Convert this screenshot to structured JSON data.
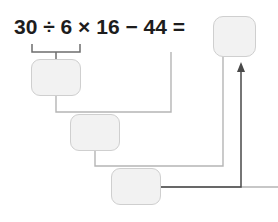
{
  "problem": {
    "type": "order-of-operations-worksheet",
    "equation_text": "30 ÷ 6 × 16 − 44 =",
    "terms": {
      "operand_1": "30",
      "operator_1": "÷",
      "operand_2": "6",
      "operator_2": "×",
      "operand_3": "16",
      "operator_3": "−",
      "operand_4": "44",
      "equals": "="
    }
  },
  "boxes": {
    "step1": {
      "value": "",
      "placeholder": ""
    },
    "step2": {
      "value": "",
      "placeholder": ""
    },
    "step3": {
      "value": "",
      "placeholder": ""
    },
    "answer": {
      "value": "",
      "placeholder": ""
    }
  },
  "colors": {
    "box_fill": "#f2f2f2",
    "box_border": "#cfcfcf",
    "connector": "#b5b5b5",
    "bracket": "#6e6e6e",
    "arrow": "#4a4a4a",
    "text": "#1d1d1d",
    "background": "#ffffff"
  }
}
